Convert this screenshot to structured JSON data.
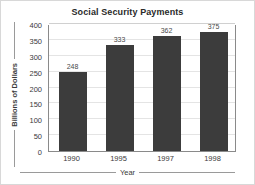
{
  "chart_data": {
    "type": "bar",
    "title": "Social Security Payments",
    "xlabel": "Year",
    "ylabel": "Billions of Dollars",
    "categories": [
      "1990",
      "1995",
      "1997",
      "1998"
    ],
    "values": [
      248,
      333,
      362,
      375
    ],
    "value_labels": [
      "248",
      "333",
      "362",
      "375"
    ],
    "ylim": [
      0,
      400
    ],
    "ytick_values": [
      0,
      50,
      100,
      150,
      200,
      250,
      300,
      350,
      400
    ],
    "ytick_labels": [
      "0",
      "50",
      "100",
      "150",
      "200",
      "250",
      "300",
      "350",
      "400"
    ],
    "grid": true,
    "legend": false,
    "colors": {
      "bar": "#3c3c3c",
      "plot_background": "#ffffff",
      "gridline": "#e4e4e4",
      "axis_line": "#8a8a8a",
      "text": "#3a3a3a",
      "title_text": "#2a2a2a",
      "value_label": "#4a4a4a",
      "frame": "#d8d8d8"
    }
  }
}
